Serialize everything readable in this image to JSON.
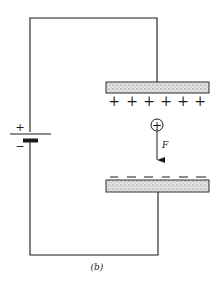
{
  "diagram": {
    "type": "circuit",
    "battery": {
      "positive_label": "+",
      "negative_label": "−"
    },
    "upper_plate": {
      "charge_sign": "+",
      "charge_count": 6
    },
    "lower_plate": {
      "charge_sign": "−",
      "charge_count": 6
    },
    "test_charge": {
      "symbol": "+"
    },
    "force": {
      "label": "F",
      "direction": "down"
    },
    "caption": "(b)"
  },
  "colors": {
    "line": "#1a1a1a",
    "plate_fill": "#d8d8d8",
    "background": "#ffffff"
  }
}
